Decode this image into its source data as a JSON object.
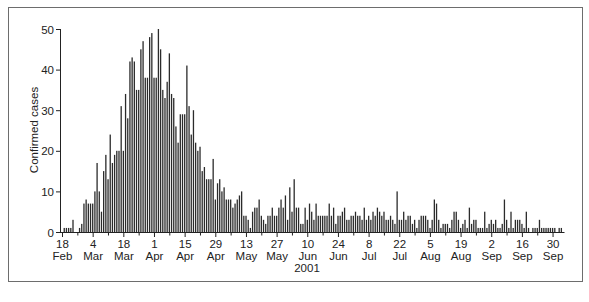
{
  "chart_data": {
    "type": "bar",
    "title": "",
    "xlabel": "2001",
    "ylabel": "Confirmed cases",
    "ylim": [
      0,
      50
    ],
    "yticks": [
      0,
      10,
      20,
      30,
      40,
      50
    ],
    "grid": false,
    "legend": null,
    "x_start": "2001-02-18",
    "x_end": "2001-09-30",
    "x_tick_labels": [
      {
        "day": "18",
        "month": "Feb"
      },
      {
        "day": "4",
        "month": "Mar"
      },
      {
        "day": "18",
        "month": "Mar"
      },
      {
        "day": "1",
        "month": "Apr"
      },
      {
        "day": "15",
        "month": "Apr"
      },
      {
        "day": "29",
        "month": "Apr"
      },
      {
        "day": "13",
        "month": "May"
      },
      {
        "day": "27",
        "month": "May"
      },
      {
        "day": "10",
        "month": "Jun"
      },
      {
        "day": "24",
        "month": "Jun"
      },
      {
        "day": "8",
        "month": "Jul"
      },
      {
        "day": "22",
        "month": "Jul"
      },
      {
        "day": "5",
        "month": "Aug"
      },
      {
        "day": "19",
        "month": "Aug"
      },
      {
        "day": "2",
        "month": "Sep"
      },
      {
        "day": "16",
        "month": "Sep"
      },
      {
        "day": "30",
        "month": "Sep"
      }
    ],
    "values": [
      0,
      1,
      1,
      1,
      1,
      3,
      0,
      0,
      1,
      2,
      7,
      8,
      7,
      7,
      7,
      10,
      17,
      10,
      5,
      15,
      19,
      13,
      24,
      17,
      19,
      20,
      20,
      31,
      20,
      34,
      28,
      42,
      43,
      42,
      35,
      35,
      45,
      47,
      38,
      38,
      48,
      49,
      38,
      38,
      50,
      45,
      35,
      33,
      37,
      44,
      34,
      33,
      26,
      22,
      29,
      29,
      29,
      41,
      31,
      24,
      30,
      22,
      20,
      21,
      15,
      16,
      13,
      13,
      13,
      18,
      8,
      12,
      13,
      10,
      11,
      8,
      8,
      8,
      6,
      7,
      8,
      9,
      10,
      4,
      4,
      3,
      1,
      5,
      6,
      6,
      8,
      4,
      3,
      2,
      4,
      4,
      6,
      4,
      4,
      6,
      8,
      6,
      9,
      3,
      11,
      5,
      13,
      6,
      6,
      2,
      2,
      6,
      3,
      7,
      5,
      3,
      7,
      4,
      4,
      4,
      4,
      4,
      7,
      4,
      6,
      2,
      4,
      4,
      5,
      6,
      3,
      3,
      4,
      4,
      5,
      4,
      4,
      3,
      6,
      3,
      4,
      3,
      5,
      4,
      6,
      5,
      4,
      5,
      3,
      3,
      4,
      3,
      2,
      10,
      3,
      3,
      5,
      3,
      4,
      4,
      2,
      3,
      1,
      3,
      4,
      4,
      4,
      3,
      1,
      3,
      8,
      7,
      3,
      1,
      2,
      2,
      2,
      1,
      3,
      5,
      5,
      3,
      1,
      2,
      3,
      1,
      6,
      2,
      3,
      3,
      1,
      1,
      1,
      5,
      1,
      2,
      3,
      2,
      3,
      1,
      1,
      2,
      8,
      3,
      1,
      5,
      1,
      3,
      3,
      3,
      2,
      1,
      5,
      1,
      0,
      1,
      1,
      1,
      3,
      1,
      1,
      1,
      1,
      1,
      1,
      1,
      0,
      1,
      1,
      0
    ]
  }
}
